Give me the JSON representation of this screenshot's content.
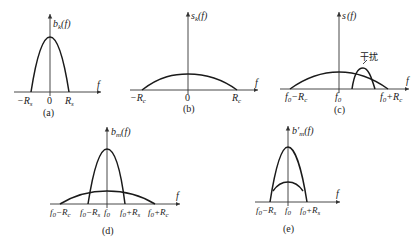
{
  "figure": {
    "panels": [
      {
        "id": "a",
        "caption": "(a)",
        "y_label_main": "b",
        "y_label_sub": "k",
        "y_label_arg": "(f)",
        "x_label": "f",
        "ticks": [
          "−R",
          "0",
          "R"
        ],
        "tick_subs": [
          "s",
          "",
          "s"
        ],
        "curves": [
          "narrow baseband pulse spectrum"
        ]
      },
      {
        "id": "b",
        "caption": "(b)",
        "y_label_main": "s",
        "y_label_sub": "k",
        "y_label_arg": "(f)",
        "x_label": "f",
        "ticks": [
          "−R",
          "0",
          "R"
        ],
        "tick_subs": [
          "c",
          "",
          "c"
        ],
        "curves": [
          "wide spread spectrum"
        ]
      },
      {
        "id": "c",
        "caption": "(c)",
        "y_label_main": "s",
        "y_label_sub": "",
        "y_label_arg": "(f)",
        "x_label": "f",
        "annotation": "干扰",
        "ticks": [
          "f0−Rc",
          "f0",
          "f0+Rc"
        ],
        "curves": [
          "wide spread spectrum centered at f0",
          "narrowband interference"
        ]
      },
      {
        "id": "d",
        "caption": "(d)",
        "y_label_main": "b",
        "y_label_sub": "m",
        "y_label_arg": "(f)",
        "x_label": "f",
        "ticks": [
          "f0−Rc",
          "f0−Rs",
          "f0",
          "f0+Rs",
          "f0+Rc"
        ],
        "curves": [
          "despread narrow signal",
          "spread interference"
        ]
      },
      {
        "id": "e",
        "caption": "(e)",
        "y_label_main": "b′",
        "y_label_sub": "m",
        "y_label_arg": "(f)",
        "x_label": "f",
        "ticks": [
          "f0−Rs",
          "f0",
          "f0+Rs"
        ],
        "curves": [
          "filtered signal",
          "residual interference"
        ]
      }
    ]
  }
}
